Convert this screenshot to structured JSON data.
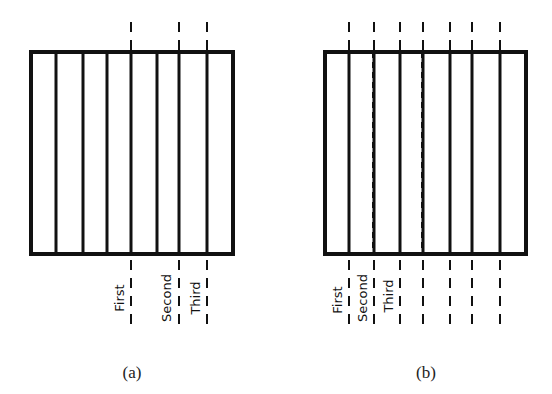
{
  "panels": [
    {
      "id": "a",
      "caption": "(a)",
      "box": {
        "x1": 31,
        "y1": 52,
        "x2": 233,
        "y2": 254
      },
      "solid_lines_x": [
        56,
        83,
        107,
        131,
        157,
        179,
        207
      ],
      "dashed_lines_x": [
        131,
        179,
        207
      ],
      "labels": [
        {
          "text": "First",
          "x": 124,
          "y": 298
        },
        {
          "text": "Second",
          "x": 171,
          "y": 298
        },
        {
          "text": "Third",
          "x": 200,
          "y": 298
        }
      ],
      "caption_pos": {
        "x": 132,
        "y": 378
      }
    },
    {
      "id": "b",
      "caption": "(b)",
      "box": {
        "x1": 325,
        "y1": 52,
        "x2": 526,
        "y2": 254
      },
      "solid_lines_x": [
        349,
        374,
        400,
        423,
        450,
        472,
        500
      ],
      "dashed_lines_x": [
        349,
        374,
        400,
        423,
        450,
        472,
        500
      ],
      "interior_dashed_x": [
        373,
        422
      ],
      "labels": [
        {
          "text": "First",
          "x": 342,
          "y": 300
        },
        {
          "text": "Second",
          "x": 367,
          "y": 298
        },
        {
          "text": "Third",
          "x": 393,
          "y": 296
        }
      ],
      "caption_pos": {
        "x": 426,
        "y": 378
      }
    }
  ],
  "style": {
    "stroke": "#111111",
    "background": "#ffffff"
  }
}
